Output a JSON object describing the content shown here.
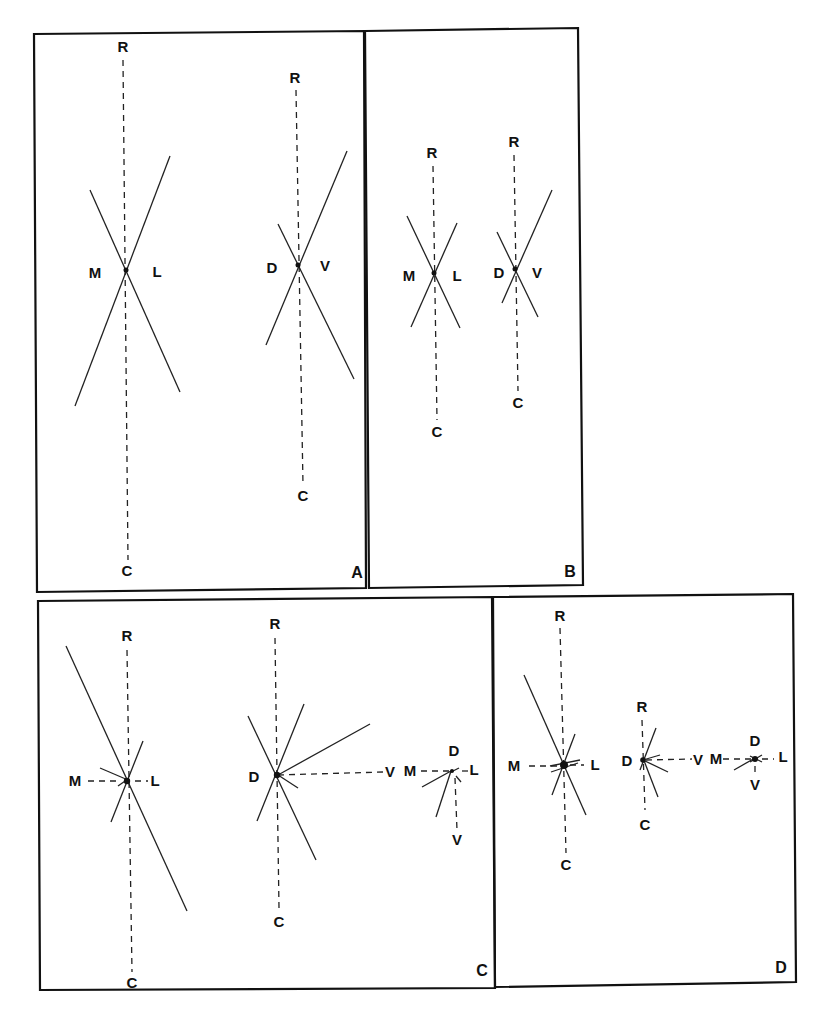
{
  "figure": {
    "panels": [
      {
        "id": "A",
        "label": "A"
      },
      {
        "id": "B",
        "label": "B"
      },
      {
        "id": "C",
        "label": "C"
      },
      {
        "id": "D",
        "label": "D"
      }
    ],
    "axis_labels": {
      "rostral": "R",
      "caudal": "C",
      "medial": "M",
      "lateral": "L",
      "dorsal": "D",
      "ventral": "V"
    }
  }
}
